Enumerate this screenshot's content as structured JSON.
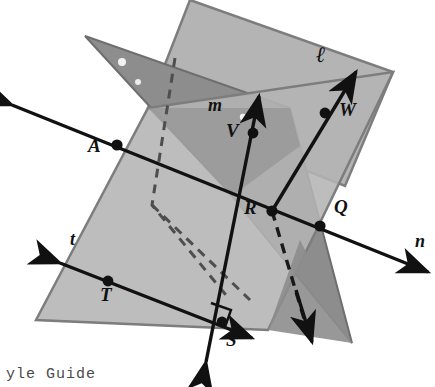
{
  "figure": {
    "type": "geometry-diagram",
    "background": "#ffffff"
  },
  "colors": {
    "plane_back": "#8f8f8f",
    "plane_front": "#b4b4b4",
    "plane_overlap": "#9e9e9e",
    "plane_edge": "#6e6e6e",
    "line": "#111111",
    "dashed": "#555555",
    "text": "#111111"
  },
  "planes": [
    {
      "name": "plane-upper-light",
      "fill": "#b4b4b4",
      "points": "190,0 393,72 345,186 148,108"
    },
    {
      "name": "plane-back-dark",
      "fill": "#8f8f8f",
      "points": "85,36 290,108 352,343 232,196"
    },
    {
      "name": "plane-front-light",
      "fill": "#b4b4b4",
      "points": "148,108 393,72 268,330 36,320"
    }
  ],
  "points": [
    {
      "id": "A",
      "label": "A",
      "x": 117,
      "y": 145,
      "label_x": 92,
      "label_y": 146
    },
    {
      "id": "V",
      "label": "V",
      "x": 253,
      "y": 133,
      "label_x": 231,
      "label_y": 131
    },
    {
      "id": "W",
      "label": "W",
      "x": 325,
      "y": 113,
      "label_x": 341,
      "label_y": 110
    },
    {
      "id": "R",
      "label": "R",
      "x": 272,
      "y": 211,
      "label_x": 248,
      "label_y": 208
    },
    {
      "id": "Q",
      "label": "Q",
      "x": 320,
      "y": 226,
      "label_x": 337,
      "label_y": 207
    },
    {
      "id": "T",
      "label": "T",
      "x": 108,
      "y": 281,
      "label_x": 101,
      "label_y": 292
    },
    {
      "id": "S",
      "label": "S",
      "x": 222,
      "y": 322,
      "label_x": 228,
      "label_y": 338
    }
  ],
  "lines": [
    {
      "id": "l",
      "label": "ℓ",
      "label_x": 320,
      "label_y": 52,
      "description": "line l through W and R, arrow up-right, dashed below R"
    },
    {
      "id": "m",
      "label": "m",
      "label_x": 213,
      "label_y": 105,
      "description": "line m through V, R and S, arrows both ends"
    },
    {
      "id": "n",
      "label": "n",
      "label_x": 417,
      "label_y": 238,
      "description": "line n through A, R and Q, arrows both ends"
    },
    {
      "id": "t",
      "label": "t",
      "label_x": 72,
      "label_y": 238,
      "description": "line t through T toward S, arrows both ends"
    }
  ],
  "markers": {
    "right_angle": {
      "name": "right-angle-marker",
      "x": 222,
      "y": 322
    },
    "highlights": [
      {
        "x": 122,
        "y": 62,
        "r": 4
      },
      {
        "x": 138,
        "y": 82,
        "r": 3
      },
      {
        "x": 243,
        "y": 117,
        "r": 3
      }
    ]
  },
  "footer": {
    "text": "yle Guide",
    "note": "partially cropped text at bottom edge"
  }
}
